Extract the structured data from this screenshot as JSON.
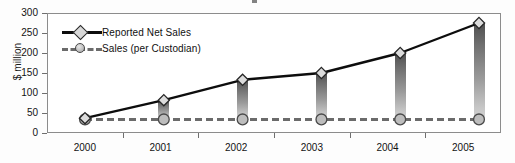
{
  "chart_data": {
    "type": "line",
    "title": "",
    "xlabel": "",
    "ylabel": "$ million",
    "categories": [
      "2000",
      "2001",
      "2002",
      "2003",
      "2004",
      "2005"
    ],
    "ylim": [
      0,
      300
    ],
    "ytick_values": [
      0,
      50,
      100,
      150,
      200,
      250,
      300
    ],
    "ytick_labels": [
      "0",
      "50",
      "100",
      "150",
      "200",
      "250",
      "300"
    ],
    "grid": false,
    "legend_position": "upper-left-inside",
    "series": [
      {
        "name": "Reported Net Sales",
        "marker": "diamond",
        "linestyle": "solid",
        "color": "#0d0d0d",
        "values": [
          37,
          82,
          133,
          150,
          200,
          275
        ]
      },
      {
        "name": "Sales (per Custodian)",
        "marker": "circle",
        "linestyle": "dashed",
        "color": "#6b6b6b",
        "values": [
          34,
          34,
          34,
          34,
          34,
          34
        ]
      }
    ],
    "connector_bars": {
      "description": "vertical gradient bars joining the two series at each category",
      "color_top": "#4f4f4f",
      "color_bottom": "#d2d2d2"
    }
  },
  "legend": {
    "items": [
      {
        "label": "Reported Net Sales"
      },
      {
        "label": "Sales (per Custodian)"
      }
    ]
  },
  "axes": {
    "y_axis_title": "$ million"
  }
}
